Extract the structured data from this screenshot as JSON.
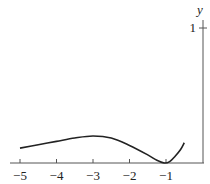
{
  "chart_data": {
    "type": "line",
    "title": "",
    "xlabel": "",
    "ylabel": "y",
    "xlim": [
      -5.1,
      0
    ],
    "ylim": [
      0,
      1.05
    ],
    "grid": false,
    "x_ticks": [
      "−5",
      "−4",
      "−3",
      "−2",
      "−1"
    ],
    "y_ticks": [
      "1"
    ],
    "series": [
      {
        "name": "curve",
        "x": [
          -5,
          -4.5,
          -4,
          -3.5,
          -3,
          -2.5,
          -2,
          -1.5,
          -1.25,
          -1.05,
          -0.9,
          -0.75,
          -0.6,
          -0.5
        ],
        "y": [
          0.11,
          0.135,
          0.16,
          0.185,
          0.2,
          0.185,
          0.13,
          0.06,
          0.02,
          0.0,
          0.01,
          0.05,
          0.1,
          0.15
        ]
      }
    ]
  }
}
